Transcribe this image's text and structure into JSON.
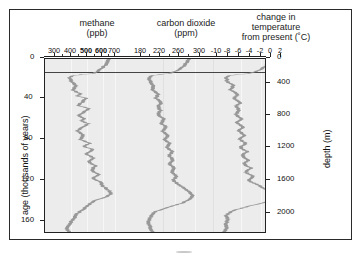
{
  "figure": {
    "background_color": "#ffffff",
    "plot_background_color": "#ececec",
    "curve_color": "#909090",
    "frame_color": "#222222"
  },
  "axes": {
    "methane": {
      "title_line1": "methane",
      "title_line2": "(ppb)",
      "ticks": [
        "300",
        "400",
        "500",
        "600",
        "700"
      ],
      "values": [
        300,
        400,
        500,
        600,
        700
      ],
      "unit": "ppb",
      "range": [
        250,
        750
      ]
    },
    "carbon_dioxide": {
      "title_line1": "carbon dioxide",
      "title_line2": "(ppm)",
      "ticks": [
        "180",
        "220",
        "260",
        "300"
      ],
      "values": [
        180,
        220,
        260,
        300
      ],
      "unit": "ppm",
      "range": [
        170,
        320
      ]
    },
    "temperature": {
      "title_line1": "change in",
      "title_line2": "temperature",
      "title_line3": "from present (˚C)",
      "ticks": [
        "-10",
        "-8",
        "-6",
        "-4",
        "-2",
        "0",
        "2"
      ],
      "values": [
        -10,
        -8,
        -6,
        -4,
        -2,
        0,
        2
      ],
      "unit": "˚C",
      "range": [
        -11,
        3
      ]
    },
    "left": {
      "title": "age (thousands of years)",
      "ticks": [
        "0",
        "40",
        "80",
        "120",
        "160"
      ],
      "values": [
        0,
        40,
        80,
        120,
        160
      ],
      "range": [
        0,
        170
      ]
    },
    "right": {
      "title": "depth (m)",
      "ticks": [
        "0",
        "400",
        "800",
        "1200",
        "1600",
        "2000"
      ],
      "values": [
        0,
        400,
        800,
        1200,
        1600,
        2000
      ],
      "range": [
        0,
        2200
      ]
    }
  },
  "chart_data": {
    "type": "line",
    "title": "",
    "xlabel": "",
    "ylabel": "age (thousands of years)",
    "grid": false,
    "legend": "none",
    "orientation": "vertical-depth-profile",
    "y": "age_ka",
    "ylim": [
      0,
      170
    ],
    "series": [
      {
        "name": "methane",
        "unit": "ppb",
        "xlim": [
          250,
          750
        ],
        "age_ka": [
          0,
          5,
          10,
          14,
          16,
          18,
          22,
          26,
          30,
          34,
          36,
          38,
          42,
          45,
          48,
          52,
          55,
          58,
          60,
          63,
          66,
          70,
          74,
          78,
          82,
          85,
          88,
          92,
          96,
          100,
          104,
          108,
          112,
          116,
          120,
          124,
          128,
          131,
          134,
          138,
          142,
          146,
          150,
          155,
          160,
          164,
          168
        ],
        "values": [
          690,
          660,
          620,
          560,
          400,
          370,
          380,
          420,
          390,
          460,
          430,
          500,
          470,
          430,
          520,
          480,
          440,
          490,
          460,
          520,
          470,
          430,
          480,
          450,
          530,
          480,
          560,
          500,
          560,
          520,
          580,
          540,
          600,
          560,
          620,
          640,
          690,
          700,
          660,
          560,
          520,
          480,
          430,
          400,
          370,
          340,
          360
        ]
      },
      {
        "name": "carbon dioxide",
        "unit": "ppm",
        "xlim": [
          170,
          320
        ],
        "age_ka": [
          0,
          5,
          10,
          14,
          16,
          18,
          22,
          26,
          30,
          34,
          38,
          42,
          46,
          50,
          54,
          58,
          62,
          66,
          70,
          74,
          78,
          82,
          86,
          90,
          94,
          98,
          102,
          106,
          110,
          114,
          118,
          122,
          126,
          130,
          133,
          136,
          140,
          144,
          148,
          152,
          156,
          160,
          164,
          168
        ],
        "values": [
          285,
          278,
          265,
          240,
          195,
          190,
          192,
          200,
          196,
          212,
          205,
          220,
          210,
          218,
          212,
          225,
          218,
          230,
          222,
          235,
          228,
          240,
          232,
          245,
          238,
          248,
          240,
          252,
          244,
          256,
          248,
          262,
          275,
          290,
          295,
          288,
          270,
          235,
          205,
          195,
          190,
          188,
          192,
          198
        ]
      },
      {
        "name": "change in temperature from present",
        "unit": "˚C",
        "xlim": [
          -11,
          3
        ],
        "age_ka": [
          0,
          5,
          10,
          14,
          16,
          18,
          22,
          26,
          30,
          34,
          38,
          42,
          46,
          50,
          54,
          58,
          62,
          66,
          70,
          74,
          78,
          82,
          86,
          90,
          94,
          98,
          102,
          106,
          110,
          114,
          118,
          122,
          126,
          130,
          133,
          136,
          140,
          144,
          148,
          152,
          156,
          160,
          164,
          168
        ],
        "values": [
          0.2,
          -0.3,
          -1.5,
          -4.0,
          -8.5,
          -9.0,
          -8.8,
          -7.5,
          -8.2,
          -6.5,
          -7.4,
          -6.0,
          -7.0,
          -6.2,
          -7.2,
          -5.8,
          -6.8,
          -5.5,
          -6.4,
          -5.2,
          -6.2,
          -5.0,
          -6.0,
          -4.6,
          -5.8,
          -4.2,
          -5.4,
          -3.8,
          -5.0,
          -3.2,
          -4.4,
          -2.4,
          -1.0,
          1.2,
          2.0,
          1.0,
          -1.5,
          -5.0,
          -8.0,
          -9.0,
          -8.6,
          -9.2,
          -8.8,
          -9.4
        ]
      }
    ],
    "annotations": [
      {
        "name": "holocene-boundary-line",
        "age_ka": 15,
        "description": "horizontal line near top of plot"
      }
    ]
  }
}
